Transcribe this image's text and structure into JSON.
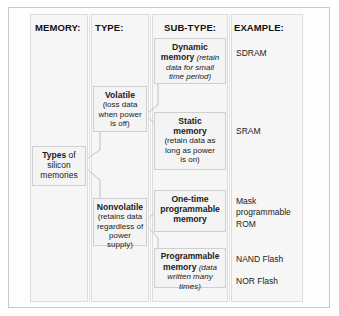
{
  "diagram": {
    "title_columns": [
      {
        "id": "memory",
        "label": "MEMORY:"
      },
      {
        "id": "type",
        "label": "TYPE:"
      },
      {
        "id": "subtype",
        "label": "SUB-TYPE:"
      },
      {
        "id": "example",
        "label": "EXAMPLE:"
      }
    ],
    "root": {
      "bold": "Types",
      "rest": " of",
      "line2": "silicon",
      "line3": "memories"
    },
    "types": [
      {
        "id": "volatile",
        "bold": "Volatile",
        "detail_lines": [
          "(loss data",
          "when power",
          "is off)"
        ]
      },
      {
        "id": "nonvolatile",
        "bold": "Nonvolatile",
        "detail_lines": [
          "(retains data",
          "regardless of",
          "power supply)"
        ]
      }
    ],
    "subtypes": [
      {
        "id": "dynamic-memory",
        "bold_line1": "Dynamic",
        "bold_line2": "memory",
        "detail_inline": " (retain",
        "detail_lines": [
          "data for small",
          "time period)"
        ]
      },
      {
        "id": "static-memory",
        "bold_line1": "Static",
        "bold_line2": "memory",
        "detail_inline": "",
        "detail_lines": [
          "(retain data as",
          "long as power",
          "is on)"
        ]
      },
      {
        "id": "one-time-programmable-memory",
        "bold_line1": "One-time",
        "bold_line2": "programmable",
        "bold_line3": "memory",
        "detail_inline": "",
        "detail_lines": []
      },
      {
        "id": "programmable-memory",
        "bold_line1": "Programmable",
        "bold_line2": "memory",
        "detail_inline": " (data",
        "detail_lines": [
          "written many times)"
        ]
      }
    ],
    "examples": [
      {
        "id": "sdram",
        "lines": [
          "SDRAM"
        ]
      },
      {
        "id": "sram",
        "lines": [
          "SRAM"
        ]
      },
      {
        "id": "mask-programmable-rom",
        "lines": [
          "Mask",
          "programmable",
          "ROM"
        ]
      },
      {
        "id": "nand-flash",
        "lines": [
          "NAND Flash"
        ]
      },
      {
        "id": "nor-flash",
        "lines": [
          "NOR Flash"
        ]
      }
    ]
  }
}
